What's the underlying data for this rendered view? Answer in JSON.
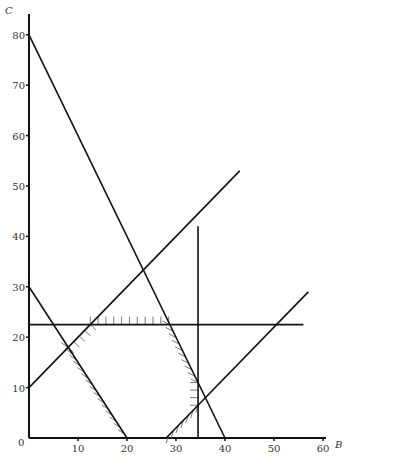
{
  "chart_data": {
    "type": "line",
    "title": "",
    "xlabel": "B",
    "ylabel": "C",
    "xlim": [
      0,
      62
    ],
    "ylim": [
      0,
      84
    ],
    "x_ticks": [
      0,
      10,
      20,
      30,
      40,
      50,
      60
    ],
    "y_ticks": [
      10,
      20,
      30,
      40,
      50,
      60,
      70,
      80
    ],
    "grid": false,
    "legend": null,
    "series": [
      {
        "name": "C = 80 - 2B",
        "points": [
          [
            0,
            80
          ],
          [
            40,
            0
          ]
        ]
      },
      {
        "name": "C = 30 - 1.5B",
        "points": [
          [
            0,
            30
          ],
          [
            20,
            0
          ]
        ]
      },
      {
        "name": "C = B + 10",
        "points": [
          [
            0,
            10
          ],
          [
            43,
            53
          ]
        ]
      },
      {
        "name": "C = B - 28",
        "points": [
          [
            28,
            0
          ],
          [
            57,
            29
          ]
        ]
      },
      {
        "name": "C = 22.5",
        "points": [
          [
            0,
            22.5
          ],
          [
            56,
            22.5
          ]
        ]
      },
      {
        "name": "B = 34.5",
        "points": [
          [
            34.5,
            0
          ],
          [
            34.5,
            42
          ]
        ]
      }
    ],
    "hatched_boundaries": [
      {
        "line": "C = 22.5",
        "from": [
          12.5,
          22.5
        ],
        "to": [
          28.5,
          22.5
        ],
        "side": "above"
      },
      {
        "line": "C = 80 - 2B",
        "from": [
          28.7,
          22.5
        ],
        "to": [
          34.5,
          11
        ],
        "side": "left"
      },
      {
        "line": "B = 34.5",
        "from": [
          34.5,
          11
        ],
        "to": [
          34.5,
          6.5
        ],
        "side": "left"
      },
      {
        "line": "C = B - 28",
        "from": [
          34.5,
          6.5
        ],
        "to": [
          28,
          0
        ],
        "side": "below"
      },
      {
        "line": "C = 30 - 1.5B",
        "from": [
          8,
          18
        ],
        "to": [
          20,
          0
        ],
        "side": "left"
      },
      {
        "line": "C = B + 10",
        "from": [
          8,
          18
        ],
        "to": [
          12.5,
          22.5
        ],
        "side": "below"
      }
    ]
  },
  "axes": {
    "x_label": "B",
    "y_label": "C",
    "origin_label": "0",
    "x_tick_labels": [
      "10",
      "20",
      "30",
      "40",
      "50",
      "60"
    ],
    "y_tick_labels": [
      "10",
      "20",
      "30",
      "40",
      "50",
      "60",
      "70",
      "80"
    ]
  }
}
